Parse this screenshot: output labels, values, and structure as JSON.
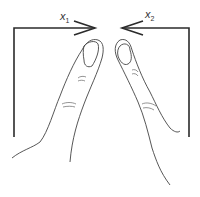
{
  "diagram": {
    "labels": {
      "left_arrow": {
        "base": "x",
        "subscript": "1"
      },
      "right_arrow": {
        "base": "x",
        "subscript": "2"
      }
    },
    "colors": {
      "line": "#2b2b2b",
      "background": "#ffffff"
    }
  }
}
